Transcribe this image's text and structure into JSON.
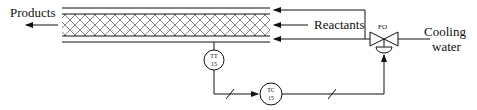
{
  "diagram": {
    "labels": {
      "products": "Products",
      "reactants": "Reactants",
      "cooling_line1": "Cooling",
      "cooling_line2": "water",
      "valve_tag": "FO"
    },
    "instruments": [
      {
        "id": "tt",
        "type": "TT",
        "loop": "15"
      },
      {
        "id": "tc",
        "type": "TC",
        "loop": "15"
      }
    ],
    "colors": {
      "line": "#111111",
      "background": "#ffffff"
    }
  }
}
